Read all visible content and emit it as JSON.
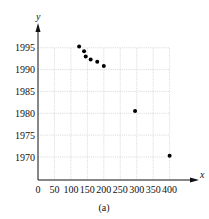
{
  "chart_data": {
    "type": "scatter",
    "title": "",
    "caption": "(a)",
    "xlabel": "x",
    "ylabel": "y",
    "xlim": [
      0,
      400
    ],
    "ylim": [
      1966,
      1997
    ],
    "x_ticks": [
      0,
      50,
      100,
      150,
      200,
      250,
      300,
      350,
      400
    ],
    "y_ticks": [
      1970,
      1975,
      1980,
      1985,
      1990,
      1995
    ],
    "grid": true,
    "legend": null,
    "points": [
      {
        "x": 125,
        "y": 1995.3
      },
      {
        "x": 140,
        "y": 1994.2
      },
      {
        "x": 145,
        "y": 1993
      },
      {
        "x": 160,
        "y": 1992.3
      },
      {
        "x": 180,
        "y": 1991.8
      },
      {
        "x": 200,
        "y": 1990.8
      },
      {
        "x": 295,
        "y": 1980.5
      },
      {
        "x": 400,
        "y": 1970.3
      }
    ]
  },
  "layout": {
    "origin_px": [
      38,
      180
    ],
    "x_px_per_unit": 0.329,
    "y_px_at_1970": 157,
    "y_px_per_year": 4.37,
    "plot_right_px": 170,
    "plot_top_px": 48
  }
}
